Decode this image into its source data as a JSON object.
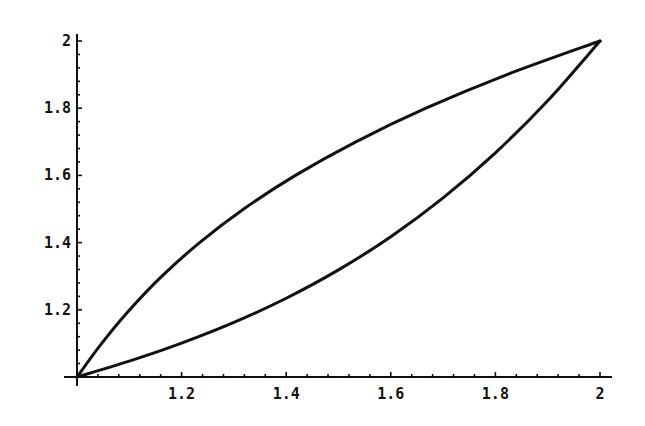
{
  "chart_data": {
    "type": "line",
    "title": "",
    "xlabel": "",
    "ylabel": "",
    "xlim": [
      1,
      2
    ],
    "ylim": [
      1,
      2
    ],
    "grid": false,
    "legend": null,
    "x_ticks": [
      1.2,
      1.4,
      1.6,
      1.8,
      2
    ],
    "x_tick_labels": [
      "1.2",
      "1.4",
      "1.6",
      "1.8",
      "2"
    ],
    "y_ticks": [
      1.2,
      1.4,
      1.6,
      1.8,
      2
    ],
    "y_tick_labels": [
      "1.2",
      "1.4",
      "1.6",
      "1.8",
      "2"
    ],
    "minor_ticks_per_major": 5,
    "line_color": "#111111",
    "series": [
      {
        "name": "upper curve",
        "x": [
          1.0,
          1.0472,
          1.1008,
          1.1624,
          1.2344,
          1.3188,
          1.4176,
          1.5332,
          1.6672,
          1.8222,
          2.0
        ],
        "y": [
          1.0,
          1.1,
          1.2,
          1.3,
          1.4,
          1.5,
          1.6,
          1.7,
          1.8,
          1.9,
          2.0
        ]
      },
      {
        "name": "lower curve",
        "x": [
          1.0,
          1.1,
          1.2,
          1.3,
          1.4,
          1.5,
          1.6,
          1.7,
          1.8,
          1.9,
          2.0
        ],
        "y": [
          1.0,
          1.0472,
          1.1008,
          1.1624,
          1.2344,
          1.3188,
          1.4176,
          1.5332,
          1.6672,
          1.8222,
          2.0
        ]
      }
    ]
  }
}
